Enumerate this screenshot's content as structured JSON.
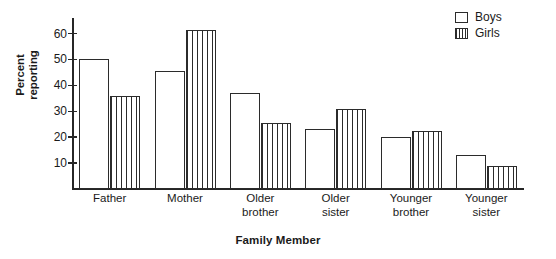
{
  "chart_data": {
    "type": "bar",
    "title": "",
    "xlabel": "Family Member",
    "ylabel": "Percent\nreporting",
    "categories": [
      "Father",
      "Mother",
      "Older\nbrother",
      "Older\nsister",
      "Younger\nbrother",
      "Younger\nsister"
    ],
    "series": [
      {
        "name": "Boys",
        "values": [
          50,
          45.5,
          37,
          23,
          20,
          13
        ],
        "style": "open"
      },
      {
        "name": "Girls",
        "values": [
          36,
          61.5,
          25.5,
          31,
          22.5,
          9
        ],
        "style": "vertical-stripes"
      }
    ],
    "ylim": [
      0,
      66
    ],
    "yticks": [
      10,
      20,
      30,
      40,
      50,
      60
    ],
    "ytick_labels": [
      "10",
      "20",
      "30",
      "40",
      "50",
      "60"
    ],
    "grid": false,
    "legend_position": "top-right",
    "colors": {
      "line": "#2b2b2b",
      "background": "#ffffff",
      "text": "#1a1a1a"
    }
  },
  "legend": {
    "entries": [
      {
        "label": "Boys",
        "swatch": "open-square-icon"
      },
      {
        "label": "Girls",
        "swatch": "striped-square-icon"
      }
    ]
  }
}
